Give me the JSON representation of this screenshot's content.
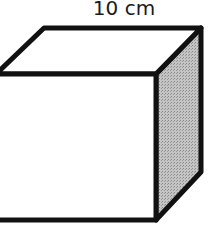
{
  "diagram": {
    "type": "cube",
    "edge_label": "10 cm",
    "colors": {
      "stroke": "#111111",
      "front_face": "#ffffff",
      "top_face": "#ffffff",
      "side_face": "#b8b8b8"
    }
  }
}
